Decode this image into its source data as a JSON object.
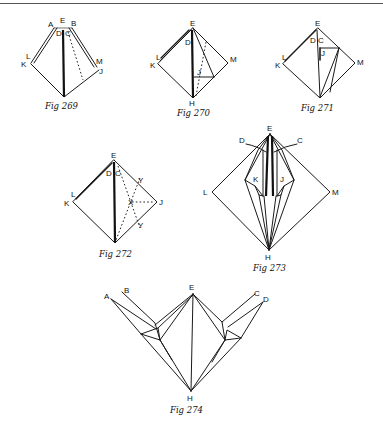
{
  "page": {
    "background": "#ffffff",
    "ink": "#111111"
  },
  "figures": [
    {
      "id": "fig269",
      "caption": "Fig 269",
      "labels": {
        "A": "A",
        "E": "E",
        "B": "B",
        "D": "D",
        "C": "C",
        "L": "L",
        "K": "K",
        "M": "M",
        "J": "J"
      }
    },
    {
      "id": "fig270",
      "caption": "Fig 270",
      "labels": {
        "E": "E",
        "D": "D",
        "L": "L",
        "K": "K",
        "J": "J",
        "M": "M",
        "H": "H"
      }
    },
    {
      "id": "fig271",
      "caption": "Fig 271",
      "labels": {
        "E": "E",
        "D": "D",
        "C": "C",
        "L": "L",
        "K": "K",
        "J": "J",
        "M": "M"
      }
    },
    {
      "id": "fig272",
      "caption": "Fig 272",
      "labels": {
        "E": "E",
        "D": "D",
        "C": "C",
        "L": "L",
        "K": "K",
        "Y1": "Y",
        "X": "X",
        "J": "J",
        "Y2": "Y"
      }
    },
    {
      "id": "fig273",
      "caption": "Fig 273",
      "labels": {
        "E": "E",
        "D": "D",
        "C": "C",
        "K": "K",
        "J": "J",
        "L": "L",
        "M": "M",
        "H": "H"
      }
    },
    {
      "id": "fig274",
      "caption": "Fig 274",
      "labels": {
        "A": "A",
        "B": "B",
        "E": "E",
        "C": "C",
        "D": "D",
        "H": "H"
      }
    }
  ]
}
